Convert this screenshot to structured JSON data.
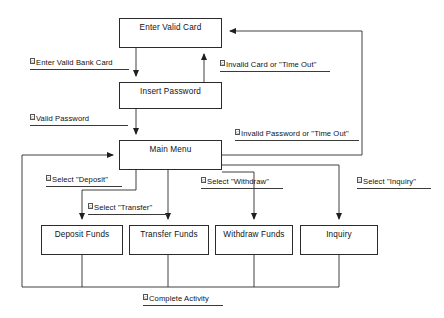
{
  "diagram": {
    "type": "state-transition-diagram",
    "stroke_color": "#2b2b2b",
    "background_color": "#ffffff",
    "nodes": [
      {
        "id": "enter-valid-card",
        "label": "Enter Valid Card",
        "x": 119,
        "y": 18,
        "w": 103,
        "h": 30
      },
      {
        "id": "insert-password",
        "label": "Insert Password",
        "x": 119,
        "y": 82,
        "w": 103,
        "h": 27
      },
      {
        "id": "main-menu",
        "label": "Main Menu",
        "x": 119,
        "y": 140,
        "w": 103,
        "h": 30
      },
      {
        "id": "deposit-funds",
        "label": "Deposit Funds",
        "x": 41,
        "y": 225,
        "w": 82,
        "h": 30
      },
      {
        "id": "transfer-funds",
        "label": "Transfer Funds",
        "x": 129,
        "y": 225,
        "w": 80,
        "h": 30
      },
      {
        "id": "withdraw-funds",
        "label": "Withdraw Funds",
        "x": 215,
        "y": 225,
        "w": 78,
        "h": 30
      },
      {
        "id": "inquiry",
        "label": "Inquiry",
        "x": 300,
        "y": 225,
        "w": 78,
        "h": 30
      }
    ],
    "edge_labels": [
      {
        "id": "enter-valid-bank-card",
        "marker": "C",
        "text": "Enter Valid Bank Card",
        "x": 30,
        "y": 58,
        "width": 99
      },
      {
        "id": "invalid-card-or-time-out",
        "marker": "C",
        "text": "Invalid Card or \"Time Out\"",
        "x": 220,
        "y": 60,
        "width": 110
      },
      {
        "id": "valid-password",
        "marker": "C",
        "text": "Valid Password",
        "x": 30,
        "y": 114,
        "width": 98
      },
      {
        "id": "invalid-password-or-time-out",
        "marker": "C",
        "text": "Invalid Password or \"Time Out\"",
        "x": 235,
        "y": 129,
        "width": 124
      },
      {
        "id": "select-deposit",
        "marker": "C",
        "text": "Select \"Deposit\"",
        "x": 46,
        "y": 175,
        "width": 76
      },
      {
        "id": "select-withdraw",
        "marker": "C",
        "text": "Select \"Withdraw\"",
        "x": 201,
        "y": 177,
        "width": 82
      },
      {
        "id": "select-inquiry",
        "marker": "C",
        "text": "Select \"Inquiry\"",
        "x": 357,
        "y": 177,
        "width": 74
      },
      {
        "id": "select-transfer",
        "marker": "C",
        "text": "Select \"Transfer\"",
        "x": 88,
        "y": 203,
        "width": 80
      },
      {
        "id": "complete-activity",
        "marker": "C",
        "text": "Complete Activity",
        "x": 143,
        "y": 294,
        "width": 80
      }
    ],
    "transitions": [
      {
        "from": "enter-valid-card",
        "to": "insert-password",
        "label": "Enter Valid Bank Card"
      },
      {
        "from": "insert-password",
        "to": "enter-valid-card",
        "label": "Invalid Card or \"Time Out\""
      },
      {
        "from": "insert-password",
        "to": "main-menu",
        "label": "Valid Password"
      },
      {
        "from": "main-menu",
        "to": "enter-valid-card",
        "label": "Invalid Password or \"Time Out\""
      },
      {
        "from": "main-menu",
        "to": "deposit-funds",
        "label": "Select \"Deposit\""
      },
      {
        "from": "main-menu",
        "to": "transfer-funds",
        "label": "Select \"Transfer\""
      },
      {
        "from": "main-menu",
        "to": "withdraw-funds",
        "label": "Select \"Withdraw\""
      },
      {
        "from": "main-menu",
        "to": "inquiry",
        "label": "Select \"Inquiry\""
      },
      {
        "from": "deposit-funds",
        "to": "main-menu",
        "label": "Complete Activity"
      },
      {
        "from": "transfer-funds",
        "to": "main-menu",
        "label": "Complete Activity"
      },
      {
        "from": "withdraw-funds",
        "to": "main-menu",
        "label": "Complete Activity"
      },
      {
        "from": "inquiry",
        "to": "main-menu",
        "label": "Complete Activity"
      }
    ]
  }
}
